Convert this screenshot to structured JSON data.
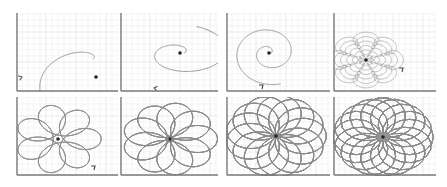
{
  "figure": {
    "layout": {
      "rows": 2,
      "cols": 4
    },
    "colors": {
      "background": "#ffffff",
      "grid_minor": "#ececec",
      "grid_major": "#dcdcdc",
      "axis": "#7a7a7a",
      "curve": "#8a8a8a",
      "center_dot": "#222222"
    },
    "panels": [
      {
        "id": 1,
        "kind": "open-spiral-single-turn",
        "x": 16,
        "y": 13,
        "w": 102,
        "h": 79
      },
      {
        "id": 2,
        "kind": "spiral-one-and-half-turns",
        "x": 120,
        "y": 13,
        "w": 98,
        "h": 79
      },
      {
        "id": 3,
        "kind": "spiral-multiple-turns",
        "x": 226,
        "y": 13,
        "w": 104,
        "h": 79
      },
      {
        "id": 4,
        "kind": "rosette-flower",
        "x": 333,
        "y": 13,
        "w": 103,
        "h": 79
      },
      {
        "id": 5,
        "kind": "epicycle-loops-sparse",
        "x": 16,
        "y": 97,
        "w": 102,
        "h": 79
      },
      {
        "id": 6,
        "kind": "epicycle-loops-medium",
        "x": 120,
        "y": 97,
        "w": 98,
        "h": 79
      },
      {
        "id": 7,
        "kind": "epicycle-loops-dense",
        "x": 226,
        "y": 97,
        "w": 104,
        "h": 79
      },
      {
        "id": 8,
        "kind": "epicycle-loops-densest",
        "x": 333,
        "y": 97,
        "w": 103,
        "h": 79
      }
    ]
  }
}
